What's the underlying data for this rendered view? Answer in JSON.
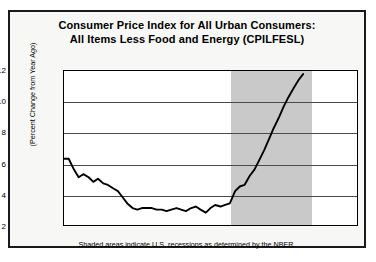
{
  "chart_data": {
    "type": "line",
    "title_line1": "Consumer Price Index for All Urban Consumers:",
    "title_line2": "All Items Less Food and Energy (CPILFESL)",
    "ylabel": "(Percent Change from Year Ago)",
    "xlabel": "",
    "footnote": "Shaded areas indicate U.S. recessions as determined by the NBER.",
    "xlim": [
      1971,
      1976
    ],
    "ylim": [
      2,
      12
    ],
    "yticks": [
      2,
      4,
      6,
      8,
      10,
      12
    ],
    "xticks": [
      1971,
      1972,
      1973,
      1974,
      1975,
      1976
    ],
    "grid": true,
    "legend": "none",
    "line_color": "#000000",
    "recession_color": "#c9c9c9",
    "recession_bands": [
      [
        1973.83,
        1975.2
      ]
    ],
    "series": [
      {
        "name": "CPILFESL Percent Change from Year Ago",
        "x": [
          1971.0,
          1971.08,
          1971.17,
          1971.25,
          1971.33,
          1971.42,
          1971.5,
          1971.58,
          1971.67,
          1971.75,
          1971.83,
          1971.92,
          1972.0,
          1972.08,
          1972.17,
          1972.25,
          1972.33,
          1972.42,
          1972.5,
          1972.58,
          1972.67,
          1972.75,
          1972.83,
          1972.92,
          1973.0,
          1973.08,
          1973.17,
          1973.25,
          1973.33,
          1973.42,
          1973.5,
          1973.58,
          1973.67,
          1973.75,
          1973.83,
          1973.92,
          1974.0,
          1974.08,
          1974.17,
          1974.25,
          1974.33,
          1974.42,
          1974.5,
          1974.58,
          1974.67,
          1974.75,
          1974.83,
          1974.92,
          1975.0,
          1975.08
        ],
        "values": [
          6.3,
          6.3,
          5.6,
          5.1,
          5.3,
          5.1,
          4.8,
          5.0,
          4.7,
          4.6,
          4.4,
          4.2,
          3.8,
          3.4,
          3.1,
          3.0,
          3.1,
          3.1,
          3.1,
          3.0,
          3.0,
          2.9,
          3.0,
          3.1,
          3.0,
          2.9,
          3.1,
          3.2,
          3.0,
          2.8,
          3.1,
          3.3,
          3.2,
          3.3,
          3.4,
          4.2,
          4.5,
          4.6,
          5.2,
          5.6,
          6.2,
          6.9,
          7.6,
          8.3,
          9.0,
          9.7,
          10.3,
          10.9,
          11.4,
          11.8
        ]
      }
    ]
  }
}
